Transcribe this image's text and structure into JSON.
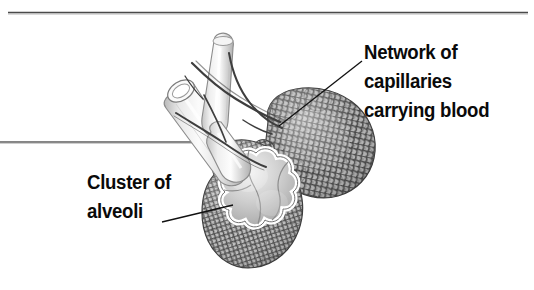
{
  "figure": {
    "background_color": "#ffffff",
    "text_color": "#0a0a0a",
    "rule_color": "#555555",
    "labels": {
      "capillaries": {
        "line1": "Network of",
        "line2": "capillaries",
        "line3": "carrying blood"
      },
      "alveoli": {
        "line1": "Cluster of",
        "line2": "alveoli"
      }
    },
    "rules": {
      "top_divider": {
        "x1": 8,
        "y1": 12,
        "x2": 528,
        "y2": 12
      },
      "left_divider": {
        "x1": 0,
        "y1": 142,
        "x2": 196,
        "y2": 142
      }
    },
    "leaders": {
      "capillaries": {
        "x1": 362,
        "y1": 61,
        "x2": 279,
        "y2": 126
      },
      "alveoli": {
        "x1": 162,
        "y1": 222,
        "x2": 233,
        "y2": 205
      }
    },
    "parts": [
      {
        "name": "bronchiole-tube-cut",
        "description": "cut-open airway tube with elliptical opening"
      },
      {
        "name": "bronchiole-tube-vertical",
        "description": "upright airway branch"
      },
      {
        "name": "blood-vessels",
        "description": "thin dark vessels running along the airways"
      },
      {
        "name": "capillary-network-mass",
        "description": "dense mesh of capillaries over alveolar sac"
      },
      {
        "name": "alveoli-cluster-cutaway",
        "description": "grape-like alveolar sacs shown in cross section"
      }
    ]
  }
}
